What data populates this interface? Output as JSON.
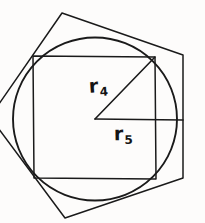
{
  "figure": {
    "background_color": "#fdfcfb",
    "stroke_color": "#1a1a1a",
    "width": 205,
    "height": 223,
    "labels": {
      "r4": {
        "base": "r",
        "subscript": "4"
      },
      "r5": {
        "base": "r",
        "subscript": "5"
      }
    }
  },
  "chart_data": {
    "type": "diagram",
    "elements": [
      {
        "name": "circle",
        "shape": "circle",
        "center": [
          95,
          119
        ],
        "radius": 82
      },
      {
        "name": "square",
        "shape": "polygon",
        "sides": 4,
        "vertices": [
          [
            33,
            56
          ],
          [
            155,
            57
          ],
          [
            156,
            179
          ],
          [
            34,
            178
          ]
        ]
      },
      {
        "name": "pentagon",
        "shape": "polygon",
        "sides": 5,
        "vertices": [
          [
            62,
            13
          ],
          [
            183,
            55
          ],
          [
            183,
            178
          ],
          [
            65,
            218
          ],
          [
            -10,
            117
          ]
        ]
      },
      {
        "name": "radius-r4",
        "shape": "segment",
        "from": [
          95,
          119
        ],
        "to": [
          155,
          57
        ],
        "label": "r4"
      },
      {
        "name": "radius-r5",
        "shape": "segment",
        "from": [
          95,
          119
        ],
        "to": [
          183,
          120
        ],
        "label": "r5"
      }
    ],
    "annotations": [
      {
        "text": "r4",
        "position": [
          89,
          76
        ],
        "meaning": "radius to square vertex"
      },
      {
        "text": "r5",
        "position": [
          114,
          124
        ],
        "meaning": "radius to pentagon edge"
      }
    ]
  }
}
